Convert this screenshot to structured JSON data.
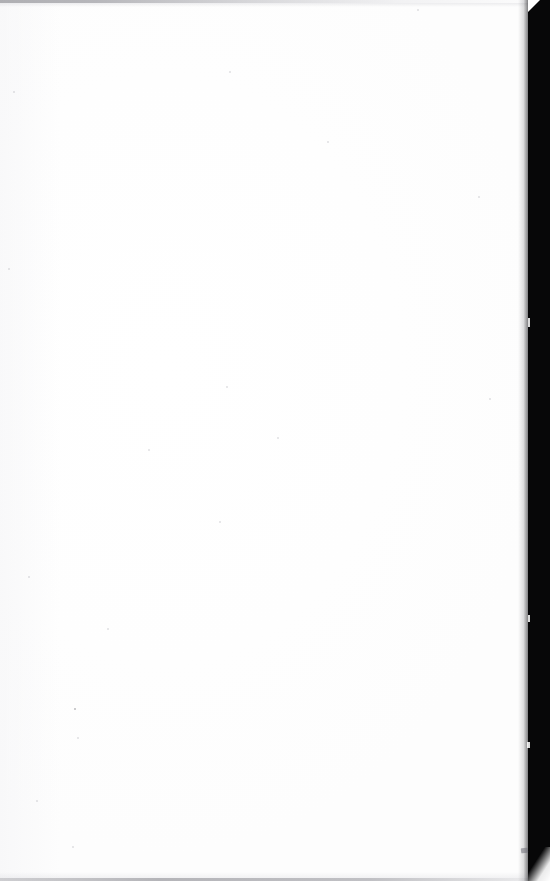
{
  "page": {
    "kind": "scanned-blank-page",
    "width": 550,
    "height": 881,
    "content_text": "",
    "visible_text": "none",
    "background_color": "#ffffff",
    "paper_color": "#fefefe"
  },
  "artifacts": {
    "gutter": {
      "name": "binding-gutter-shadow",
      "position": "right-edge",
      "color": "#070708",
      "width_px": 22,
      "tapers_at_bottom": true,
      "notch_at_top": true
    },
    "penumbra": {
      "name": "gutter-penumbra",
      "color": "#19191c"
    },
    "top_edge_line": {
      "name": "scan-edge-line-top",
      "color": "#96969b",
      "height_px": 3,
      "fades_to_right": true
    },
    "bottom_edge_line": {
      "name": "scan-edge-line-bottom",
      "color": "#9696a0",
      "height_px": 3
    },
    "smudge": {
      "name": "smudge-mark",
      "color": "#6e6e76",
      "x": 521,
      "y": 848
    },
    "speckles": [
      {
        "x": 417,
        "y": 9,
        "size": 2,
        "dark": false
      },
      {
        "x": 229,
        "y": 71,
        "size": 2,
        "dark": false
      },
      {
        "x": 13,
        "y": 91,
        "size": 2,
        "dark": false
      },
      {
        "x": 327,
        "y": 141,
        "size": 2,
        "dark": false
      },
      {
        "x": 8,
        "y": 268,
        "size": 2,
        "dark": false
      },
      {
        "x": 226,
        "y": 386,
        "size": 2,
        "dark": false
      },
      {
        "x": 277,
        "y": 437,
        "size": 2,
        "dark": false
      },
      {
        "x": 148,
        "y": 449,
        "size": 2,
        "dark": false
      },
      {
        "x": 219,
        "y": 521,
        "size": 2,
        "dark": false
      },
      {
        "x": 28,
        "y": 576,
        "size": 2,
        "dark": false
      },
      {
        "x": 107,
        "y": 628,
        "size": 2,
        "dark": false
      },
      {
        "x": 74,
        "y": 708,
        "size": 2,
        "dark": true
      },
      {
        "x": 77,
        "y": 737,
        "size": 2,
        "dark": false
      },
      {
        "x": 36,
        "y": 800,
        "size": 2,
        "dark": false
      },
      {
        "x": 72,
        "y": 846,
        "size": 2,
        "dark": false
      },
      {
        "x": 489,
        "y": 398,
        "size": 2,
        "dark": false
      },
      {
        "x": 478,
        "y": 196,
        "size": 2,
        "dark": false
      }
    ]
  }
}
